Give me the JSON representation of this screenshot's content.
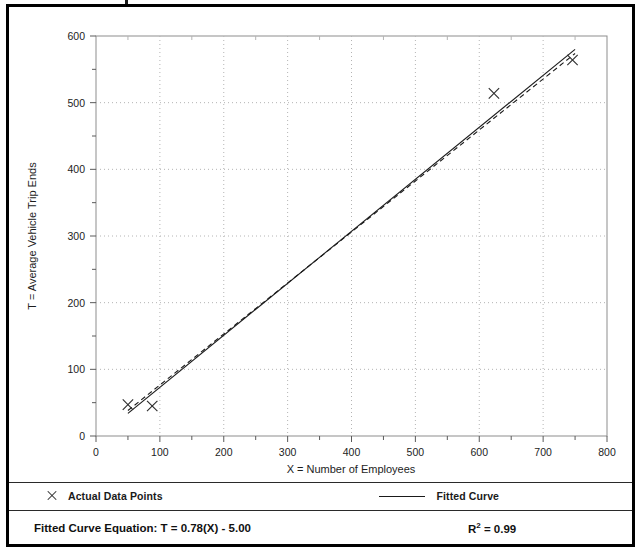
{
  "chart_data": {
    "type": "scatter",
    "title": "",
    "xlabel": "X = Number of Employees",
    "ylabel": "T = Average Vehicle Trip Ends",
    "xlim": [
      0,
      800
    ],
    "ylim": [
      0,
      600
    ],
    "xticks": [
      0,
      100,
      200,
      300,
      400,
      500,
      600,
      700,
      800
    ],
    "yticks": [
      0,
      100,
      200,
      300,
      400,
      500,
      600
    ],
    "xtick_labels": [
      "0",
      "100",
      "200",
      "300",
      "400",
      "500",
      "600",
      "700",
      "800"
    ],
    "ytick_labels": [
      "0",
      "100",
      "200",
      "300",
      "400",
      "500",
      "600"
    ],
    "minor_tick_step": 50,
    "grid": "dotted",
    "legend_position": "below-plot",
    "series": [
      {
        "name": "Actual Data Points",
        "type": "scatter",
        "marker": "x",
        "points": [
          {
            "x": 50,
            "y": 47
          },
          {
            "x": 88,
            "y": 45
          },
          {
            "x": 623,
            "y": 514
          },
          {
            "x": 746,
            "y": 564
          }
        ]
      },
      {
        "name": "Fitted Curve",
        "type": "line",
        "style": "solid",
        "slope": 0.78,
        "intercept": -5.0,
        "x": [
          50,
          750
        ],
        "y": [
          34,
          580
        ]
      },
      {
        "name": "Average Rate",
        "type": "line",
        "style": "dashed",
        "slope": 0.765,
        "intercept": 0,
        "x": [
          50,
          750
        ],
        "y": [
          38.25,
          573.75
        ]
      }
    ]
  },
  "axes": {
    "x_axis_title": "X = Number of Employees",
    "y_axis_title": "T = Average Vehicle Trip Ends"
  },
  "legend": {
    "items": [
      {
        "marker": "x-marker",
        "label": "Actual Data Points"
      },
      {
        "marker": "solid-line",
        "label": "Fitted Curve"
      },
      {
        "marker": "dashed-line",
        "label": "Average Rate"
      }
    ]
  },
  "footer": {
    "equation_label": "Fitted Curve Equation:",
    "equation": "T = 0.78(X) - 5.00",
    "equation_full": "Fitted Curve Equation:  T = 0.78(X) - 5.00",
    "r_squared_symbol": "R",
    "r_squared_exponent": "2",
    "r_squared_value": "= 0.99",
    "r_squared_full": "R2 = 0.99"
  },
  "colors": {
    "frame": "#000000",
    "plot_border": "#8d8d8d",
    "grid": "#b4b4b4",
    "line": "#1a1a1a",
    "marker": "#2b2b2b",
    "text": "#1d1d1d",
    "background": "#ffffff"
  }
}
